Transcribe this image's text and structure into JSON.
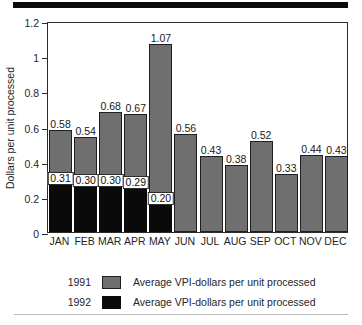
{
  "chart_data": {
    "type": "bar",
    "title": "",
    "xlabel": "",
    "ylabel": "Dollars per unit processed",
    "ylim": [
      0,
      1.2
    ],
    "yticks": [
      "0",
      "0.2",
      "0.4",
      "0.6",
      "0.8",
      "1",
      "1.2"
    ],
    "ytick_values": [
      0,
      0.2,
      0.4,
      0.6,
      0.8,
      1,
      1.2
    ],
    "grid": false,
    "legend_position": "bottom",
    "categories": [
      "JAN",
      "FEB",
      "MAR",
      "APR",
      "MAY",
      "JUN",
      "JUL",
      "AUG",
      "SEP",
      "OCT",
      "NOV",
      "DEC"
    ],
    "series": [
      {
        "name": "1991",
        "legend_label": "Average VPI-dollars per unit processed",
        "color": "#6f6f6f",
        "values": [
          0.58,
          0.54,
          0.68,
          0.67,
          1.07,
          0.56,
          0.43,
          0.38,
          0.52,
          0.33,
          0.44,
          0.43
        ],
        "labels": [
          "0.58",
          "0.54",
          "0.68",
          "0.67",
          "1.07",
          "0.56",
          "0.43",
          "0.38",
          "0.52",
          "0.33",
          "0.44",
          "0.43"
        ]
      },
      {
        "name": "1992",
        "legend_label": "Average VPI-dollars per unit processed",
        "color": "#0a0a0a",
        "values": [
          0.31,
          0.3,
          0.3,
          0.29,
          0.2,
          null,
          null,
          null,
          null,
          null,
          null,
          null
        ],
        "labels": [
          "0.31",
          "0.30",
          "0.30",
          "0.29",
          "0.20",
          "",
          "",
          "",
          "",
          "",
          "",
          ""
        ]
      }
    ]
  },
  "legend": {
    "rows": [
      {
        "year": "1991",
        "text": "Average VPI-dollars per unit processed"
      },
      {
        "year": "1992",
        "text": "Average VPI-dollars per unit processed"
      }
    ]
  }
}
